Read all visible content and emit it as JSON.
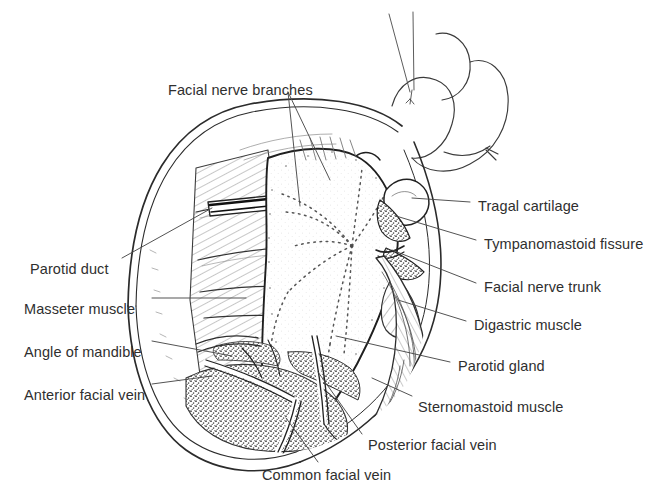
{
  "figure": {
    "background_color": "#ffffff",
    "ink_color": "#2a2a2a",
    "label_color": "#2f2f2f",
    "stipple_dark_color": "#4a4a4a",
    "labels": [
      {
        "id": "facial-nerve-branches",
        "text": "Facial nerve branches",
        "x": 168,
        "y": 82
      },
      {
        "id": "tragal-cartilage",
        "text": "Tragal cartilage",
        "x": 478,
        "y": 198
      },
      {
        "id": "tympanomastoid-fissure",
        "text": "Tympanomastoid fissure",
        "x": 484,
        "y": 236
      },
      {
        "id": "facial-nerve-trunk",
        "text": "Facial nerve trunk",
        "x": 484,
        "y": 279
      },
      {
        "id": "digastric-muscle",
        "text": "Digastric muscle",
        "x": 474,
        "y": 317
      },
      {
        "id": "parotid-gland",
        "text": "Parotid gland",
        "x": 458,
        "y": 358
      },
      {
        "id": "sternomastoid-muscle",
        "text": "Sternomastoid muscle",
        "x": 418,
        "y": 399
      },
      {
        "id": "posterior-facial-vein",
        "text": "Posterior facial vein",
        "x": 368,
        "y": 437
      },
      {
        "id": "common-facial-vein",
        "text": "Common facial vein",
        "x": 262,
        "y": 467
      },
      {
        "id": "parotid-duct",
        "text": "Parotid duct",
        "x": 30,
        "y": 261
      },
      {
        "id": "masseter-muscle",
        "text": "Masseter muscle",
        "x": 24,
        "y": 301
      },
      {
        "id": "angle-of-mandible",
        "text": "Angle of mandible",
        "x": 24,
        "y": 344
      },
      {
        "id": "anterior-facial-vein",
        "text": "Anterior facial vein",
        "x": 24,
        "y": 387
      }
    ],
    "structures": [
      {
        "id": "auricle",
        "name": "ear auricle outline"
      },
      {
        "id": "skin-flap",
        "name": "reflected skin flap"
      },
      {
        "id": "parotid-gland-body",
        "name": "parotid gland body"
      },
      {
        "id": "facial-nerve-plexus",
        "name": "dotted facial nerve branch plexus"
      },
      {
        "id": "masseter",
        "name": "masseter muscle hatched"
      },
      {
        "id": "sternomastoid",
        "name": "sternomastoid muscle hatched"
      },
      {
        "id": "digastric",
        "name": "digastric muscle"
      },
      {
        "id": "stippled-tissue",
        "name": "stippled areolar tissue"
      },
      {
        "id": "vein-network",
        "name": "facial vein network"
      },
      {
        "id": "parotid-duct-bar",
        "name": "parotid duct"
      }
    ]
  }
}
